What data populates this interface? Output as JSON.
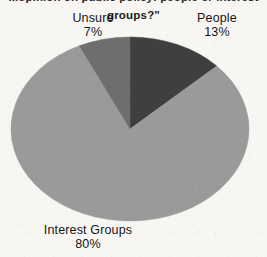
{
  "chart_data": {
    "type": "pie",
    "title": "groups?\"",
    "title_clipped_line": "...opinion on public policy: people or interest",
    "title_note": "top line of the question is cut off at the image edge; only the final line is legible",
    "categories": [
      "Interest Groups",
      "People",
      "Unsure"
    ],
    "values": [
      80,
      13,
      7
    ],
    "value_unit": "%",
    "labels": [
      {
        "name": "Interest Groups",
        "percent": "80%",
        "value": 80,
        "color": "#9a9a9a"
      },
      {
        "name": "People",
        "percent": "13%",
        "value": 13,
        "color": "#3f3f3f"
      },
      {
        "name": "Unsure",
        "percent": "7%",
        "value": 7,
        "color": "#6e6e6e"
      }
    ],
    "legend": "none (labels placed outside slices)",
    "start_angle_deg": 0,
    "direction": "clockwise",
    "slice_order_clockwise_from_top": [
      "People",
      "Interest Groups",
      "Unsure"
    ],
    "colors": {
      "interest_groups": "#9a9a9a",
      "people": "#3f3f3f",
      "unsure": "#6e6e6e",
      "background": "#f7f6f3",
      "text": "#161616"
    }
  },
  "geometry": {
    "cx": 120,
    "cy": 93,
    "rx": 119,
    "ry": 92
  }
}
